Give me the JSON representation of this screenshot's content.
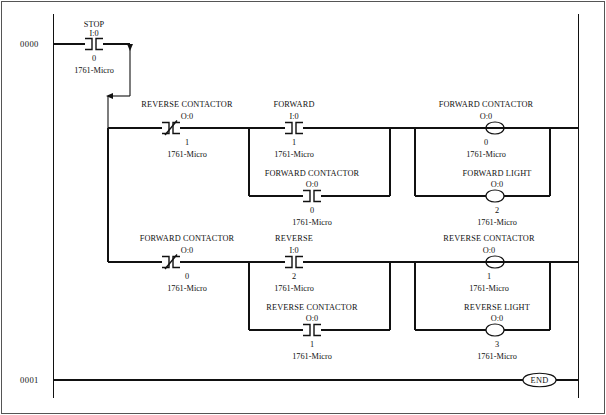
{
  "document": {
    "type": "ladder-logic-diagram",
    "controller": "1761-Micro",
    "width": 606,
    "height": 415,
    "ink_color": "#111111",
    "background_color": "#ffffff"
  },
  "rungs": [
    {
      "number": "0000",
      "elements": [
        {
          "kind": "contact",
          "style": "normally-closed",
          "label": "STOP",
          "address": "I:0",
          "bit": "0",
          "device": "1761-Micro"
        }
      ]
    },
    {
      "number": "",
      "branch_label": "forward-rung",
      "elements": [
        {
          "kind": "contact",
          "style": "normally-closed",
          "label": "REVERSE CONTACTOR",
          "address": "O:0",
          "bit": "1",
          "device": "1761-Micro"
        },
        {
          "kind": "contact",
          "style": "normally-open",
          "label": "FORWARD",
          "address": "I:0",
          "bit": "1",
          "device": "1761-Micro"
        },
        {
          "kind": "contact",
          "style": "normally-open",
          "label": "FORWARD CONTACTOR",
          "address": "O:0",
          "bit": "0",
          "device": "1761-Micro",
          "position": "seal-in-branch"
        },
        {
          "kind": "coil",
          "label": "FORWARD CONTACTOR",
          "address": "O:0",
          "bit": "0",
          "device": "1761-Micro"
        },
        {
          "kind": "coil",
          "label": "FORWARD LIGHT",
          "address": "O:0",
          "bit": "2",
          "device": "1761-Micro",
          "position": "parallel-output-branch"
        }
      ]
    },
    {
      "number": "",
      "branch_label": "reverse-rung",
      "elements": [
        {
          "kind": "contact",
          "style": "normally-closed",
          "label": "FORWARD CONTACTOR",
          "address": "O:0",
          "bit": "0",
          "device": "1761-Micro"
        },
        {
          "kind": "contact",
          "style": "normally-open",
          "label": "REVERSE",
          "address": "I:0",
          "bit": "2",
          "device": "1761-Micro"
        },
        {
          "kind": "contact",
          "style": "normally-open",
          "label": "REVERSE CONTACTOR",
          "address": "O:0",
          "bit": "1",
          "device": "1761-Micro",
          "position": "seal-in-branch"
        },
        {
          "kind": "coil",
          "label": "REVERSE CONTACTOR",
          "address": "O:0",
          "bit": "1",
          "device": "1761-Micro"
        },
        {
          "kind": "coil",
          "label": "REVERSE LIGHT",
          "address": "O:0",
          "bit": "3",
          "device": "1761-Micro",
          "position": "parallel-output-branch"
        }
      ]
    },
    {
      "number": "0001",
      "elements": [
        {
          "kind": "coil",
          "label": "",
          "text": "END",
          "address": "",
          "bit": "",
          "device": ""
        }
      ]
    }
  ],
  "labels": {
    "rung0": "0000",
    "rung1": "0001",
    "end_coil": "END",
    "stop": {
      "name": "STOP",
      "addr": "I:0",
      "bit": "0",
      "dev": "1761-Micro"
    },
    "rev_contactor_nc": {
      "name": "REVERSE CONTACTOR",
      "addr": "O:0",
      "bit": "1",
      "dev": "1761-Micro"
    },
    "forward_no": {
      "name": "FORWARD",
      "addr": "I:0",
      "bit": "1",
      "dev": "1761-Micro"
    },
    "fwd_contactor_seal": {
      "name": "FORWARD CONTACTOR",
      "addr": "O:0",
      "bit": "0",
      "dev": "1761-Micro"
    },
    "fwd_contactor_coil": {
      "name": "FORWARD CONTACTOR",
      "addr": "O:0",
      "bit": "0",
      "dev": "1761-Micro"
    },
    "fwd_light_coil": {
      "name": "FORWARD LIGHT",
      "addr": "O:0",
      "bit": "2",
      "dev": "1761-Micro"
    },
    "fwd_contactor_nc": {
      "name": "FORWARD CONTACTOR",
      "addr": "O:0",
      "bit": "0",
      "dev": "1761-Micro"
    },
    "reverse_no": {
      "name": "REVERSE",
      "addr": "I:0",
      "bit": "2",
      "dev": "1761-Micro"
    },
    "rev_contactor_seal": {
      "name": "REVERSE CONTACTOR",
      "addr": "O:0",
      "bit": "1",
      "dev": "1761-Micro"
    },
    "rev_contactor_coil": {
      "name": "REVERSE CONTACTOR",
      "addr": "O:0",
      "bit": "1",
      "dev": "1761-Micro"
    },
    "rev_light_coil": {
      "name": "REVERSE LIGHT",
      "addr": "O:0",
      "bit": "3",
      "dev": "1761-Micro"
    }
  }
}
